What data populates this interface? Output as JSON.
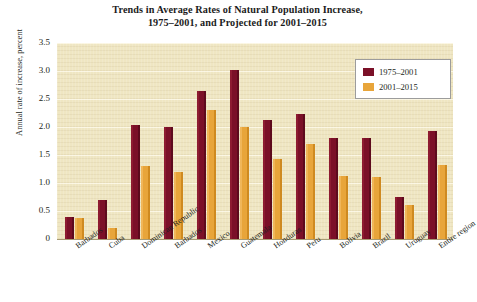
{
  "chart_data": {
    "type": "bar",
    "title": "Trends in Average Rates of Natural Population Increase, 1975–2001, and Projected for 2001–2015",
    "title_line1": "Trends in Average Rates of Natural Population Increase,",
    "title_line2": "1975–2001, and Projected for 2001–2015",
    "xlabel": "",
    "ylabel": "Annual rate of increase, percent",
    "ylim": [
      0,
      3.5
    ],
    "ytick_labels": [
      "3.5",
      "3.0",
      "2.5",
      "2.0",
      "1.5",
      "1.0",
      "0.5",
      "0"
    ],
    "ytick_values": [
      3.5,
      3.0,
      2.5,
      2.0,
      1.5,
      1.0,
      0.5,
      0
    ],
    "grid": true,
    "legend_position": "top-right",
    "categories": [
      "Barbados",
      "Cuba",
      "Dominican Republic",
      "Barbados",
      "Mexico",
      "Guatemala",
      "Honduras",
      "Peru",
      "Bolivia",
      "Brazil",
      "Uruguay",
      "Entire region"
    ],
    "series": [
      {
        "name": "1975–2001",
        "color": "#7b1028",
        "values": [
          0.4,
          0.7,
          2.03,
          2.0,
          2.65,
          3.02,
          2.12,
          2.23,
          1.8,
          1.8,
          0.75,
          1.93
        ]
      },
      {
        "name": "2001–2015",
        "color": "#e8a53a",
        "values": [
          0.38,
          0.2,
          1.3,
          1.2,
          2.3,
          2.0,
          1.42,
          1.7,
          1.12,
          1.1,
          0.6,
          1.33
        ]
      }
    ]
  },
  "colors": {
    "plot_background": "#efe6c2",
    "gridline": "#fbf6e2",
    "series_1975_2001": "#7b1028",
    "series_2001_2015": "#e8a53a",
    "axis": "#a79b74",
    "text": "#231f20",
    "legend_background": "#ffffff",
    "legend_border": "#9c9c9c"
  }
}
